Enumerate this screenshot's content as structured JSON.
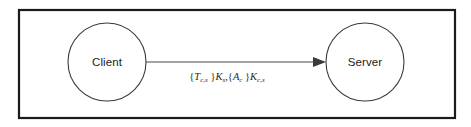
{
  "figure": {
    "kind": "protocol-message-diagram",
    "frame": {
      "border_color": "#1a1a1a",
      "background_color": "#ffffff"
    },
    "nodes": [
      {
        "id": "client",
        "label": "Client",
        "shape": "circle",
        "cx": 107,
        "cy": 62,
        "r": 39,
        "stroke_color": "#3a3a3a",
        "fill_color": "#ffffff"
      },
      {
        "id": "server",
        "label": "Server",
        "shape": "circle",
        "cx": 365,
        "cy": 62,
        "r": 39,
        "stroke_color": "#3a3a3a",
        "fill_color": "#ffffff"
      }
    ],
    "edges": [
      {
        "id": "client-to-server",
        "from": "client",
        "to": "server",
        "direction": "forward",
        "arrow_style": "solid-triangle",
        "stroke_color": "#4a4a4a",
        "label": {
          "plain": "{T c,s }K s , {A c }K c,s",
          "parts": [
            {
              "text": "{",
              "style": "brace"
            },
            {
              "text": "T",
              "style": "italic"
            },
            {
              "text": "c,s",
              "style": "subscript"
            },
            {
              "text": " }",
              "style": "brace"
            },
            {
              "text": "K",
              "style": "italic"
            },
            {
              "text": "s",
              "style": "subscript"
            },
            {
              "text": ",",
              "style": "separator"
            },
            {
              "text": "{",
              "style": "brace"
            },
            {
              "text": "A",
              "style": "italic"
            },
            {
              "text": "c",
              "style": "subscript"
            },
            {
              "text": " }",
              "style": "brace"
            },
            {
              "text": "K",
              "style": "italic"
            },
            {
              "text": "c,s",
              "style": "subscript"
            }
          ]
        }
      }
    ]
  }
}
